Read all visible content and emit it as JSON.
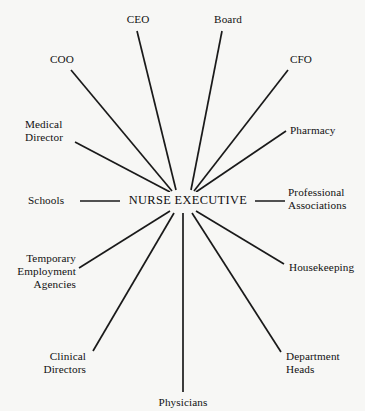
{
  "diagram": {
    "type": "radial-spoke",
    "title": "",
    "background_color": "#f7f7f5",
    "line_color": "#1a1a1a",
    "text_color": "#111111",
    "hub": {
      "label": "NURSE EXECUTIVE",
      "center_x": 183,
      "center_y": 201
    },
    "nodes": [
      {
        "id": "ceo",
        "label": "CEO",
        "align": "center",
        "label_x": 118,
        "label_y": 13,
        "label_w": 40,
        "line_x1": 137,
        "line_y1": 31,
        "line_x2": 176,
        "line_y2": 190
      },
      {
        "id": "board",
        "label": "Board",
        "align": "center",
        "label_x": 205,
        "label_y": 13,
        "label_w": 46,
        "line_x1": 222,
        "line_y1": 31,
        "line_x2": 191,
        "line_y2": 190
      },
      {
        "id": "coo",
        "label": "COO",
        "align": "center",
        "label_x": 40,
        "label_y": 53,
        "label_w": 44,
        "line_x1": 71,
        "line_y1": 70,
        "line_x2": 172,
        "line_y2": 191
      },
      {
        "id": "cfo",
        "label": "CFO",
        "align": "center",
        "label_x": 280,
        "label_y": 53,
        "label_w": 42,
        "line_x1": 288,
        "line_y1": 70,
        "line_x2": 194,
        "line_y2": 191
      },
      {
        "id": "medical-director",
        "label": "Medical\nDirector",
        "align": "left",
        "label_x": 25,
        "label_y": 118,
        "label_w": 62,
        "line_x1": 75,
        "line_y1": 142,
        "line_x2": 170,
        "line_y2": 192
      },
      {
        "id": "pharmacy",
        "label": "Pharmacy",
        "align": "left",
        "label_x": 290,
        "label_y": 124,
        "label_w": 62,
        "line_x1": 286,
        "line_y1": 131,
        "line_x2": 196,
        "line_y2": 192
      },
      {
        "id": "schools",
        "label": "Schools",
        "align": "left",
        "label_x": 28,
        "label_y": 194,
        "label_w": 48,
        "line_x1": 80,
        "line_y1": 201,
        "line_x2": 120,
        "line_y2": 201
      },
      {
        "id": "professional-associations",
        "label": "Professional\nAssociations",
        "align": "left",
        "label_x": 288,
        "label_y": 186,
        "label_w": 76,
        "line_x1": 248,
        "line_y1": 201,
        "line_x2": 285,
        "line_y2": 201
      },
      {
        "id": "temporary-employment-agencies",
        "label": "Temporary\nEmployment\nAgencies",
        "align": "right",
        "label_x": 8,
        "label_y": 252,
        "label_w": 68,
        "line_x1": 79,
        "line_y1": 268,
        "line_x2": 170,
        "line_y2": 211
      },
      {
        "id": "housekeeping",
        "label": "Housekeeping",
        "align": "left",
        "label_x": 289,
        "label_y": 261,
        "label_w": 74,
        "line_x1": 284,
        "line_y1": 264,
        "line_x2": 196,
        "line_y2": 211
      },
      {
        "id": "clinical-directors",
        "label": "Clinical\nDirectors",
        "align": "right",
        "label_x": 20,
        "label_y": 350,
        "label_w": 66,
        "line_x1": 93,
        "line_y1": 351,
        "line_x2": 174,
        "line_y2": 213
      },
      {
        "id": "department-heads",
        "label": "Department\nHeads",
        "align": "left",
        "label_x": 286,
        "label_y": 350,
        "label_w": 72,
        "line_x1": 281,
        "line_y1": 352,
        "line_x2": 192,
        "line_y2": 213
      },
      {
        "id": "physicians",
        "label": "Physicians",
        "align": "center",
        "label_x": 147,
        "label_y": 396,
        "label_w": 72,
        "line_x1": 183,
        "line_y1": 392,
        "line_x2": 183,
        "line_y2": 213
      }
    ]
  }
}
